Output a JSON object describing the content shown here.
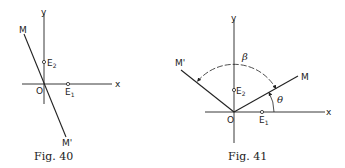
{
  "figures": [
    {
      "caption": "Fig. 40",
      "axes": {
        "x_label": "x",
        "y_label": "y"
      },
      "origin_label": "O",
      "points": [
        {
          "name": "E",
          "sub": "1",
          "on_axis": "x"
        },
        {
          "name": "E",
          "sub": "2",
          "on_axis": "y"
        }
      ],
      "line_labels": {
        "end": "M",
        "start": "M'"
      }
    },
    {
      "caption": "Fig. 41",
      "axes": {
        "x_label": "x",
        "y_label": "y"
      },
      "origin_label": "O",
      "points": [
        {
          "name": "E",
          "sub": "1",
          "on_axis": "x"
        },
        {
          "name": "E",
          "sub": "2",
          "on_axis": "y"
        }
      ],
      "line_labels": {
        "M": "M",
        "M_prime": "M'"
      },
      "angles": {
        "theta": "θ",
        "beta": "β"
      }
    }
  ],
  "colors": {
    "ink": "#222222",
    "background": "#ffffff"
  }
}
